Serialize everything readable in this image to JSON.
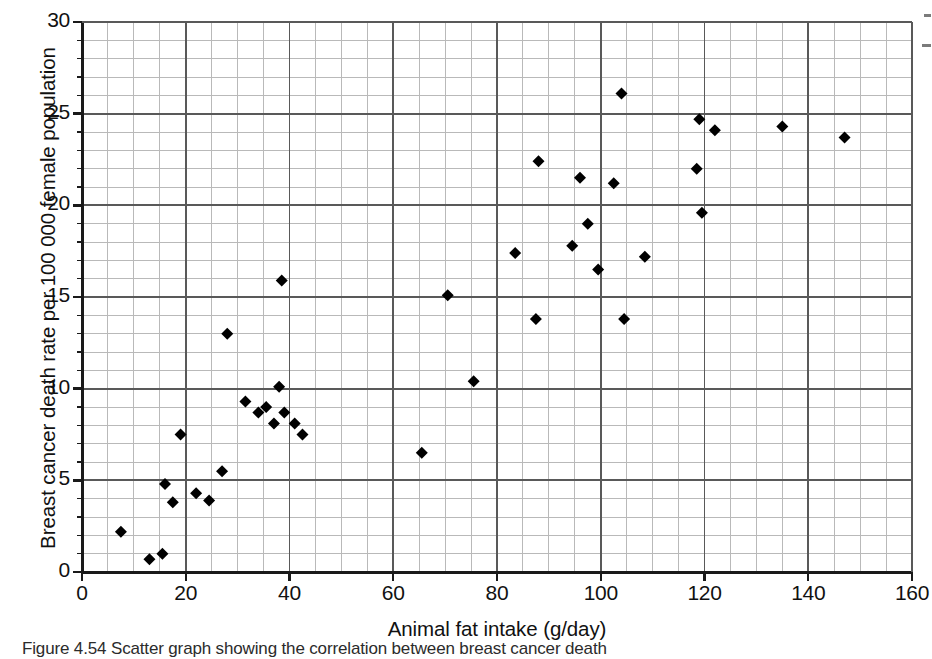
{
  "figure": {
    "caption_label": "Figure 4.54",
    "caption_text": "Scatter graph showing the correlation between breast cancer death"
  },
  "axes": {
    "x_title": "Animal fat intake (g/day)",
    "y_title": "Breast cancer death rate per 100 000 female population",
    "x_ticks": [
      "0",
      "20",
      "40",
      "60",
      "80",
      "100",
      "120",
      "140",
      "160"
    ],
    "y_ticks": [
      "0",
      "5",
      "10",
      "15",
      "20",
      "25",
      "30"
    ]
  },
  "colors": {
    "axis": "#1a1a1a",
    "grid_major": "#595959",
    "grid_minor": "#b9b9b9",
    "marker": "#000000",
    "background": "#ffffff"
  },
  "chart_data": {
    "type": "scatter",
    "title": "",
    "xlabel": "Animal fat intake (g/day)",
    "ylabel": "Breast cancer death rate per 100 000 female population",
    "xlim": [
      0,
      160
    ],
    "ylim": [
      0,
      30
    ],
    "x_major_step": 20,
    "x_minor_step": 5,
    "y_major_step": 5,
    "y_minor_step": 1,
    "grid": true,
    "legend": "none",
    "marker": "diamond",
    "series": [
      {
        "name": "Countries",
        "points": [
          [
            7.5,
            2.2
          ],
          [
            13.0,
            0.7
          ],
          [
            15.5,
            1.0
          ],
          [
            16.0,
            4.8
          ],
          [
            17.5,
            3.8
          ],
          [
            19.0,
            7.5
          ],
          [
            22.0,
            4.3
          ],
          [
            24.5,
            3.9
          ],
          [
            27.0,
            5.5
          ],
          [
            28.0,
            13.0
          ],
          [
            31.5,
            9.3
          ],
          [
            34.0,
            8.7
          ],
          [
            35.5,
            9.0
          ],
          [
            37.0,
            8.1
          ],
          [
            38.0,
            10.1
          ],
          [
            38.5,
            15.9
          ],
          [
            39.0,
            8.7
          ],
          [
            41.0,
            8.1
          ],
          [
            42.5,
            7.5
          ],
          [
            65.5,
            6.5
          ],
          [
            70.5,
            15.1
          ],
          [
            75.5,
            10.4
          ],
          [
            83.5,
            17.4
          ],
          [
            87.5,
            13.8
          ],
          [
            88.0,
            22.4
          ],
          [
            94.5,
            17.8
          ],
          [
            96.0,
            21.5
          ],
          [
            97.5,
            19.0
          ],
          [
            99.5,
            16.5
          ],
          [
            102.5,
            21.2
          ],
          [
            104.0,
            26.1
          ],
          [
            104.5,
            13.8
          ],
          [
            108.5,
            17.2
          ],
          [
            118.5,
            22.0
          ],
          [
            119.0,
            24.7
          ],
          [
            119.5,
            19.6
          ],
          [
            122.0,
            24.1
          ],
          [
            135.0,
            24.3
          ],
          [
            147.0,
            23.7
          ]
        ]
      }
    ]
  }
}
